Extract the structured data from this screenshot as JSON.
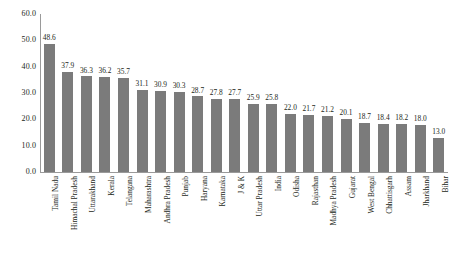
{
  "chart_data": {
    "type": "bar",
    "title": "",
    "xlabel": "",
    "ylabel": "",
    "ylim": [
      0,
      60
    ],
    "yticks": [
      "0.0",
      "10.0",
      "20.0",
      "30.0",
      "40.0",
      "50.0",
      "60.0"
    ],
    "ytick_values": [
      0,
      10,
      20,
      30,
      40,
      50,
      60
    ],
    "grid": false,
    "legend": "none",
    "bar_color": "#7b7b7b",
    "axis_color": "#9a9a9a",
    "text_color": "#231f20",
    "categories": [
      "Tamil Nadu",
      "Himachal Pradesh",
      "Uttarakhand",
      "Kerala",
      "Telangana",
      "Maharashtra",
      "Andhra Pradesh",
      "Punjab",
      "Haryana",
      "Karnataka",
      "J & K",
      "Uttar Pradesh",
      "India",
      "Odisha",
      "Rajasthan",
      "Madhya Pradesh",
      "Gujarat",
      "West Bengal",
      "Chhattisgarh",
      "Assam",
      "Jharkhand",
      "Bihar"
    ],
    "values": [
      48.6,
      37.9,
      36.3,
      36.2,
      35.7,
      31.1,
      30.9,
      30.3,
      28.7,
      27.8,
      27.7,
      25.9,
      25.8,
      22.0,
      21.7,
      21.2,
      20.1,
      18.7,
      18.4,
      18.2,
      18.0,
      13.0
    ],
    "value_labels": [
      "48.6",
      "37.9",
      "36.3",
      "36.2",
      "35.7",
      "31.1",
      "30.9",
      "30.3",
      "28.7",
      "27.8",
      "27.7",
      "25.9",
      "25.8",
      "22.0",
      "21.7",
      "21.2",
      "20.1",
      "18.7",
      "18.4",
      "18.2",
      "18.0",
      "13.0"
    ]
  }
}
